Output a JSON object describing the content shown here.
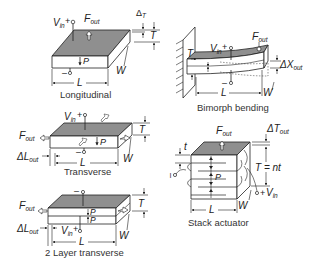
{
  "figure": {
    "panels": [
      {
        "id": "longitudinal",
        "caption": "Longitudinal",
        "labels": {
          "vin": "V",
          "vin_sub": "in",
          "plus": "+",
          "minus": "–",
          "force": "F",
          "force_sub": "out",
          "polarization": "P",
          "length": "L",
          "width": "W",
          "thickness": "T",
          "delta": "Δ",
          "delta_sub": "T"
        }
      },
      {
        "id": "bimorph-bending",
        "caption": "Bimorph bending",
        "labels": {
          "vin": "V",
          "vin_sub": "in",
          "plus": "+",
          "minus": "–",
          "force": "F",
          "force_sub": "out",
          "length": "L",
          "width": "W",
          "thickness": "T",
          "delta": "ΔX",
          "delta_sub": "out"
        }
      },
      {
        "id": "transverse",
        "caption": "Transverse",
        "labels": {
          "vin": "V",
          "vin_sub": "in",
          "plus": "+",
          "minus": "–",
          "force": "F",
          "force_sub": "out",
          "polarization": "P",
          "length": "L",
          "width": "W",
          "thickness": "T",
          "delta": "ΔL",
          "delta_sub": "out"
        }
      },
      {
        "id": "stack-actuator",
        "caption": "Stack actuator",
        "labels": {
          "vin": "V",
          "vin_sub": "in",
          "plus": "+",
          "minus": "–",
          "force": "F",
          "force_sub": "out",
          "polarization": "P",
          "length": "L",
          "width": "W",
          "layer_thickness": "t",
          "thickness_eq": "T = nt",
          "delta": "ΔT",
          "delta_sub": "out"
        }
      },
      {
        "id": "two-layer-transverse",
        "caption": "2 Layer transverse",
        "labels": {
          "vin": "V",
          "vin_sub": "in",
          "plus": "+",
          "minus": "–",
          "force": "F",
          "force_sub": "out",
          "polarization": "P",
          "length": "L",
          "width": "W",
          "thickness": "T",
          "delta": "ΔL",
          "delta_sub": "out"
        }
      }
    ]
  }
}
